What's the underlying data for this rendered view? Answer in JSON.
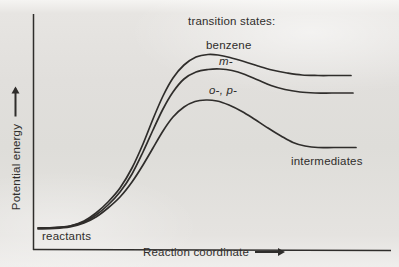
{
  "figure": {
    "colors": {
      "ink": "#2f2d2b",
      "paper": "#e1dfdc"
    }
  },
  "labels": {
    "transition_states": "transition states:",
    "benzene": "benzene",
    "meta": "m-",
    "ortho_para": "o-, p-",
    "intermediates": "intermediates",
    "reactants": "reactants"
  },
  "axes": {
    "x_label": "Reaction coordinate",
    "y_label": "Potential energy"
  },
  "chart_data": {
    "type": "line",
    "title": "",
    "xlabel": "Reaction coordinate",
    "ylabel": "Potential energy",
    "axis_ticks": "none (qualitative diagram, arrows indicate increasing direction)",
    "legend": "inline labels above each curve peak",
    "annotations": [
      "transition states:",
      "benzene",
      "m-",
      "o-, p-",
      "reactants",
      "intermediates"
    ],
    "qualitative_ordering": "activation barrier height: o-,p- < m- < benzene; curves start together at reactants level and level off at intermediate plateaus with the same ordering",
    "note": "points_px are [x,y] control points in 399x267 figure pixels, y increases downward",
    "series": [
      {
        "name": "benzene",
        "label": "benzene",
        "points_px": [
          [
            38,
            228
          ],
          [
            55,
            227.5
          ],
          [
            70,
            226
          ],
          [
            84,
            221
          ],
          [
            96,
            213
          ],
          [
            108,
            202
          ],
          [
            120,
            188
          ],
          [
            132,
            168
          ],
          [
            143,
            144
          ],
          [
            153,
            119
          ],
          [
            163,
            96
          ],
          [
            173,
            78
          ],
          [
            184,
            65
          ],
          [
            196,
            57
          ],
          [
            208,
            54.5
          ],
          [
            218,
            55
          ],
          [
            230,
            57.5
          ],
          [
            244,
            61.5
          ],
          [
            258,
            66
          ],
          [
            272,
            70
          ],
          [
            287,
            73
          ],
          [
            302,
            75
          ],
          [
            318,
            75.5
          ],
          [
            334,
            75.5
          ],
          [
            351,
            75.5
          ]
        ]
      },
      {
        "name": "m-",
        "label": "m-",
        "points_px": [
          [
            38,
            228
          ],
          [
            55,
            227.5
          ],
          [
            70,
            226
          ],
          [
            84,
            222
          ],
          [
            96,
            215
          ],
          [
            108,
            205
          ],
          [
            120,
            192
          ],
          [
            132,
            174
          ],
          [
            143,
            152
          ],
          [
            153,
            130
          ],
          [
            163,
            109
          ],
          [
            173,
            92
          ],
          [
            184,
            79
          ],
          [
            196,
            72
          ],
          [
            208,
            69.5
          ],
          [
            220,
            69
          ],
          [
            232,
            70.5
          ],
          [
            245,
            74.5
          ],
          [
            258,
            80
          ],
          [
            271,
            85.5
          ],
          [
            285,
            89.5
          ],
          [
            300,
            92
          ],
          [
            315,
            93
          ],
          [
            332,
            93
          ],
          [
            353,
            93
          ]
        ]
      },
      {
        "name": "o-, p-",
        "label": "o-, p-",
        "points_px": [
          [
            38,
            229
          ],
          [
            55,
            228.5
          ],
          [
            70,
            227
          ],
          [
            84,
            223
          ],
          [
            96,
            217
          ],
          [
            108,
            208
          ],
          [
            120,
            197
          ],
          [
            132,
            182
          ],
          [
            143,
            165
          ],
          [
            153,
            148
          ],
          [
            163,
            131
          ],
          [
            173,
            117
          ],
          [
            184,
            107
          ],
          [
            195,
            101.5
          ],
          [
            206,
            100
          ],
          [
            217,
            101
          ],
          [
            229,
            105
          ],
          [
            242,
            111.5
          ],
          [
            255,
            119.5
          ],
          [
            268,
            128
          ],
          [
            281,
            136
          ],
          [
            293,
            142.5
          ],
          [
            305,
            146
          ],
          [
            318,
            147.5
          ],
          [
            334,
            147.5
          ],
          [
            356,
            147.5
          ]
        ]
      }
    ],
    "axes_px": {
      "y_axis": [
        [
          33.5,
          14
        ],
        [
          33.5,
          250
        ]
      ],
      "x_axis": [
        [
          33,
          249.5
        ],
        [
          391,
          250.5
        ]
      ]
    }
  }
}
